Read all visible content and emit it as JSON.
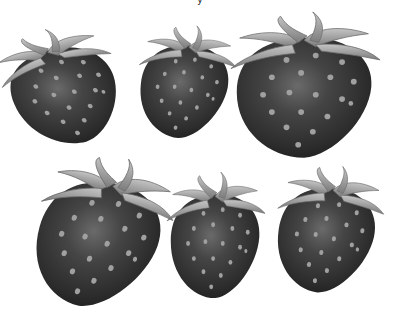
{
  "image": {
    "description": "Grayscale illustration of six strawberries arranged in two rows of three on a white background",
    "background": "#ffffff",
    "top_text_fragment": "y"
  },
  "colors": {
    "body_dark": "#2a2a2a",
    "body_mid": "#3c3c3c",
    "body_highlight": "#6a6a6a",
    "seed": "#9a9a9a",
    "seed_shadow": "#1a1a1a",
    "leaf_light": "#b8b8b8",
    "leaf_dark": "#7a7a7a"
  },
  "strawberries": [
    {
      "id": 1,
      "row": 1,
      "position": "left",
      "x": 5,
      "y": 28,
      "w": 122,
      "h": 118,
      "tilt": -25
    },
    {
      "id": 2,
      "row": 1,
      "position": "middle",
      "x": 135,
      "y": 25,
      "w": 100,
      "h": 115,
      "tilt": 8
    },
    {
      "id": 3,
      "row": 1,
      "position": "right",
      "x": 228,
      "y": 12,
      "w": 155,
      "h": 148,
      "tilt": 0
    },
    {
      "id": 4,
      "row": 2,
      "position": "left",
      "x": 30,
      "y": 155,
      "w": 138,
      "h": 155,
      "tilt": 18
    },
    {
      "id": 5,
      "row": 2,
      "position": "middle",
      "x": 165,
      "y": 172,
      "w": 102,
      "h": 128,
      "tilt": 0
    },
    {
      "id": 6,
      "row": 2,
      "position": "right",
      "x": 272,
      "y": 165,
      "w": 110,
      "h": 130,
      "tilt": 10
    }
  ]
}
